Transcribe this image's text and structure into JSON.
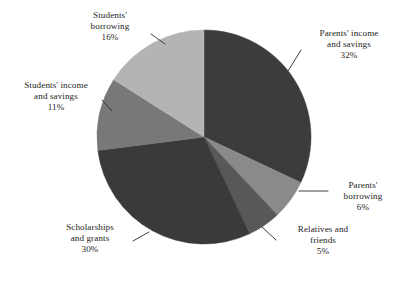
{
  "chart_data": {
    "type": "pie",
    "title": "",
    "subtitle": "",
    "xlabel": "",
    "ylabel": "",
    "legend_position": "none",
    "grid": false,
    "unit": "%",
    "start_angle_deg": 0,
    "direction": "clockwise",
    "categories": [
      "Parents' income and savings",
      "Parents' borrowing",
      "Relatives and friends",
      "Scholarships and grants",
      "Students' income and savings",
      "Students' borrowing"
    ],
    "values": [
      32,
      6,
      5,
      30,
      11,
      16
    ],
    "slices": [
      {
        "label_line1": "Parents' income",
        "label_line2": "and savings",
        "value_label": "32%",
        "value": 32,
        "color": "#3c3c3c"
      },
      {
        "label_line1": "Parents'",
        "label_line2": "borrowing",
        "value_label": "6%",
        "value": 6,
        "color": "#8a8a8a"
      },
      {
        "label_line1": "Relatives and",
        "label_line2": "friends",
        "value_label": "5%",
        "value": 5,
        "color": "#585858"
      },
      {
        "label_line1": "Scholarships",
        "label_line2": "and grants",
        "value_label": "30%",
        "value": 30,
        "color": "#3a3a3a"
      },
      {
        "label_line1": "Students' income",
        "label_line2": "and savings",
        "value_label": "11%",
        "value": 11,
        "color": "#787878"
      },
      {
        "label_line1": "Students'",
        "label_line2": "borrowing",
        "value_label": "16%",
        "value": 16,
        "color": "#b4b4b4"
      }
    ],
    "geometry": {
      "center_x": 204,
      "center_y": 137,
      "radius": 107
    },
    "background_color": "#ffffff",
    "leader_line_color": "#2a2a2a"
  }
}
